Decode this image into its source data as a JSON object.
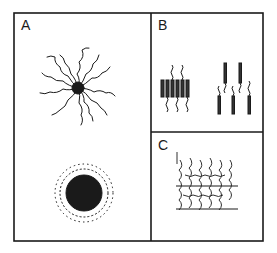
{
  "figure": {
    "panels": [
      {
        "id": "A",
        "label": "A",
        "description": "Micelles: extended-chain star micelle (top) and collapsed spherical micelle (bottom)"
      },
      {
        "id": "B",
        "label": "B",
        "description": "Rod-coil bilayer structures: side-by-side rods with coils (left), staggered rods with coils (right)"
      },
      {
        "id": "C",
        "label": "C",
        "description": "Lamellar / brush layer of entangled chains with horizontal layer lines"
      }
    ],
    "colors": {
      "ink": "#1a1a1a",
      "background": "#ffffff",
      "rod": "#333333"
    }
  }
}
